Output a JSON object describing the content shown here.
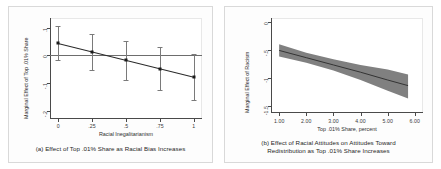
{
  "figure": {
    "panels": [
      {
        "id": "a",
        "caption": "(a) Effect of Top .01% Share as Racial Bias Increases",
        "xlabel": "Racial Inegalitarianism",
        "ylabel": "Marginal Effect of Top .01% Share",
        "xticks": [
          "0",
          ".25",
          ".5",
          ".75",
          "1"
        ],
        "yticks": [
          ".1",
          "0",
          "-.1",
          "-.2"
        ]
      },
      {
        "id": "b",
        "caption_line1": "(b) Effect of Racial Attitudes on Attitudes Toward",
        "caption_line2": "Redistribution as Top .01% Share Increases",
        "xlabel": "Top .01% Share, percent",
        "ylabel": "Marginal Effect of Racism",
        "xticks": [
          "1.00",
          "2.00",
          "3.00",
          "4.00",
          "5.00",
          "6.00"
        ],
        "yticks": [
          "0",
          "-.5",
          "-1",
          "-1.5"
        ]
      }
    ],
    "colors": {
      "band_fill": "#808080",
      "line": "#2a2a2a",
      "marker": "#1b1b1b",
      "errorbar": "#7a7a7a",
      "axis": "#4a4a4a",
      "background": "#ffffff"
    }
  },
  "chart_data": [
    {
      "type": "scatter",
      "panel": "a",
      "title": "(a) Effect of Top .01% Share as Racial Bias Increases",
      "xlabel": "Racial Inegalitarianism",
      "ylabel": "Marginal Effect of Top .01% Share",
      "xlim": [
        -0.06,
        1.06
      ],
      "ylim": [
        -0.23,
        0.135
      ],
      "xticks": [
        0,
        0.25,
        0.5,
        0.75,
        1
      ],
      "yticks": [
        0.1,
        0,
        -0.1,
        -0.2
      ],
      "grid": false,
      "legend": "none",
      "annotations": [
        "horizontal reference line at y = 0"
      ],
      "x": [
        0,
        0.25,
        0.5,
        0.75,
        1
      ],
      "values": [
        0.043,
        0.012,
        -0.018,
        -0.048,
        -0.079
      ],
      "ci_low": [
        -0.018,
        -0.052,
        -0.088,
        -0.125,
        -0.162
      ],
      "ci_high": [
        0.105,
        0.076,
        0.052,
        0.031,
        0.005
      ],
      "fit_line": {
        "x": [
          0,
          1
        ],
        "y": [
          0.043,
          -0.079
        ]
      }
    },
    {
      "type": "line",
      "panel": "b",
      "title": "(b) Effect of Racial Attitudes on Attitudes Toward Redistribution as Top .01% Share Increases",
      "xlabel": "Top .01% Share, percent",
      "ylabel": "Marginal Effect of Racism",
      "xlim": [
        0.7,
        6.3
      ],
      "ylim": [
        -1.62,
        0.08
      ],
      "xticks": [
        1,
        2,
        3,
        4,
        5,
        6
      ],
      "yticks": [
        0,
        -0.5,
        -1,
        -1.5
      ],
      "grid": false,
      "legend": "none",
      "annotations": [
        "shaded 95% confidence band"
      ],
      "x": [
        1.0,
        2.0,
        3.0,
        4.0,
        5.0,
        5.75
      ],
      "values": [
        -0.5,
        -0.63,
        -0.76,
        -0.89,
        -1.03,
        -1.13
      ],
      "ci_low": [
        -0.61,
        -0.72,
        -0.86,
        -1.03,
        -1.22,
        -1.36
      ],
      "ci_high": [
        -0.39,
        -0.54,
        -0.66,
        -0.76,
        -0.84,
        -0.93
      ]
    }
  ]
}
